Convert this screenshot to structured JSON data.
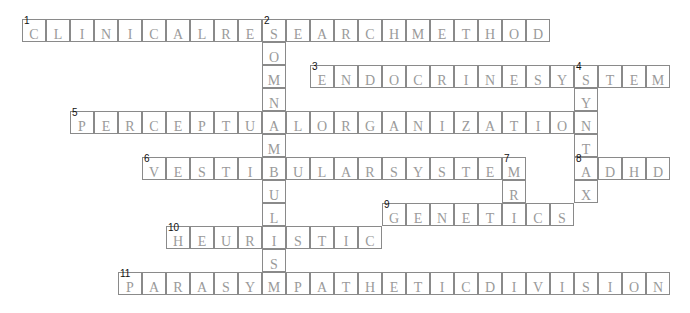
{
  "puzzle": {
    "grid": {
      "origin_x": 22,
      "origin_y": 19,
      "cell_w": 24,
      "cell_h": 23
    },
    "entries": [
      {
        "number": 1,
        "direction": "across",
        "row": 0,
        "col": 0,
        "answer": "CLINICALRESEARCHMETHOD"
      },
      {
        "number": 2,
        "direction": "down",
        "row": 0,
        "col": 10,
        "answer": "SOMNAMBULISM"
      },
      {
        "number": 3,
        "direction": "across",
        "row": 2,
        "col": 12,
        "answer": "ENDOCRINESYSTEM"
      },
      {
        "number": 4,
        "direction": "down",
        "row": 2,
        "col": 23,
        "answer": "SYNTAX"
      },
      {
        "number": 5,
        "direction": "across",
        "row": 4,
        "col": 2,
        "answer": "PERCEPTUALORGANIZATION"
      },
      {
        "number": 6,
        "direction": "across",
        "row": 6,
        "col": 5,
        "answer": "VESTIBULARSYSTEM"
      },
      {
        "number": 7,
        "direction": "down",
        "row": 6,
        "col": 20,
        "answer": "MRI"
      },
      {
        "number": 8,
        "direction": "across",
        "row": 6,
        "col": 23,
        "answer": "ADHD"
      },
      {
        "number": 9,
        "direction": "across",
        "row": 8,
        "col": 15,
        "answer": "GENETICS"
      },
      {
        "number": 10,
        "direction": "across",
        "row": 9,
        "col": 6,
        "answer": "HEURISTIC"
      },
      {
        "number": 11,
        "direction": "across",
        "row": 11,
        "col": 4,
        "answer": "PARASYMPATHETICDIVISION"
      }
    ]
  },
  "colors": {
    "border": "#8a8a8a",
    "letter": "#9a9a9a",
    "number": "#111111",
    "background": "#ffffff"
  }
}
